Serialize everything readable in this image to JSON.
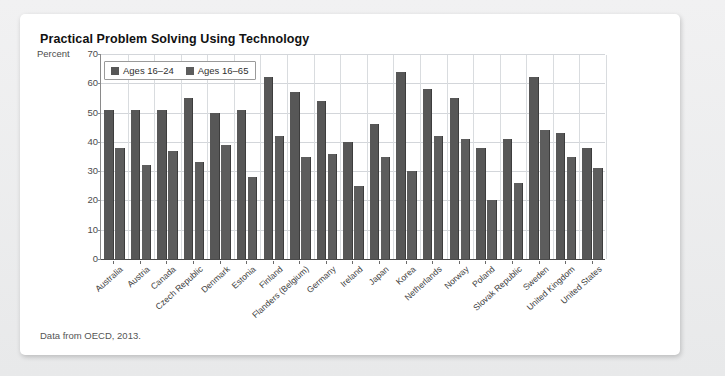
{
  "card": {
    "title": "Practical Problem Solving Using Technology",
    "footnote": "Data from OECD, 2013.",
    "axis_unit_label": "Percent"
  },
  "colors": {
    "background": "#eceded",
    "card": "#ffffff",
    "series1": "#575757",
    "series2": "#5d5d5d",
    "gridline": "#d3d6da",
    "axis": "#4a4a4a",
    "text": "#111111"
  },
  "chart_data": {
    "type": "bar",
    "title": "Practical Problem Solving Using Technology",
    "subtitle": "",
    "xlabel": "",
    "ylabel": "Percent",
    "ylim": [
      0,
      70
    ],
    "yticks": [
      0,
      10,
      20,
      30,
      40,
      50,
      60,
      70
    ],
    "grid": true,
    "legend_position": "top-left",
    "annotations": [
      "Data from OECD, 2013."
    ],
    "categories": [
      "Australia",
      "Austria",
      "Canada",
      "Czech Republic",
      "Denmark",
      "Estonia",
      "Finland",
      "Flanders (Belgium)",
      "Germany",
      "Ireland",
      "Japan",
      "Korea",
      "Netherlands",
      "Norway",
      "Poland",
      "Slovak Republic",
      "Sweden",
      "United Kingdom",
      "United States"
    ],
    "series": [
      {
        "name": "Ages 16–24",
        "values": [
          51,
          51,
          51,
          55,
          50,
          51,
          62,
          57,
          54,
          40,
          46,
          64,
          58,
          55,
          38,
          41,
          62,
          43,
          38
        ]
      },
      {
        "name": "Ages 16–65",
        "values": [
          38,
          32,
          37,
          33,
          39,
          28,
          42,
          35,
          36,
          25,
          35,
          30,
          42,
          41,
          20,
          26,
          44,
          35,
          31
        ]
      }
    ]
  }
}
